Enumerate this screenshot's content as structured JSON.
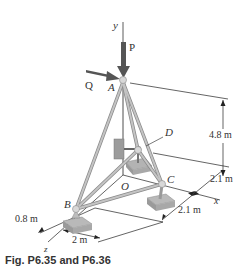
{
  "figure": {
    "caption": "Fig. P6.35 and P6.36",
    "points": {
      "A": "A",
      "B": "B",
      "C": "C",
      "D": "D",
      "O": "O"
    },
    "axes": {
      "x": "x",
      "y": "y",
      "z": "z"
    },
    "forces": {
      "P": "P",
      "Q": "Q"
    },
    "dimensions": {
      "height": "4.8 m",
      "x_upper": "2.1 m",
      "x_lower": "2.1 m",
      "z_offset": "0.8 m",
      "b_width": "2 m"
    },
    "colors": {
      "member": "#b9b9b9",
      "member_edge": "#8a8a8a",
      "force_arrow": "#555555",
      "base": "#a8a8a8",
      "line": "#222222"
    }
  }
}
